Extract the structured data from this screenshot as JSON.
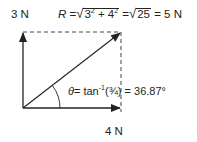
{
  "diagram": {
    "type": "vector-resultant",
    "vertical_vector": {
      "label": "3 N",
      "magnitude": 3,
      "unit": "N"
    },
    "horizontal_vector": {
      "label": "4 N",
      "magnitude": 4,
      "unit": "N"
    },
    "resultant_equation": {
      "lhs": "R",
      "eq1": "=",
      "radical1": "3",
      "exp1": "2",
      "plus": "+ 4",
      "exp2": "2",
      "eq2": "=",
      "radical2": "25",
      "result": "= 5 N"
    },
    "angle_equation": {
      "symbol": "θ",
      "text": "= tan",
      "exponent": "-1",
      "argument": "(¾) = 36.87°"
    },
    "colors": {
      "line": "#222222",
      "dashed": "#444444",
      "background": "#ffffff"
    }
  }
}
